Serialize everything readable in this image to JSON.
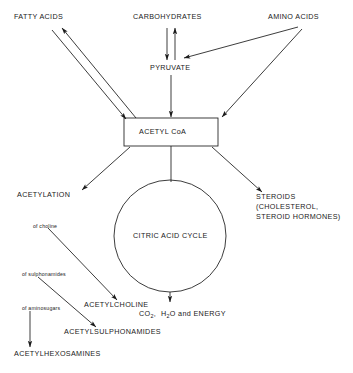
{
  "diagram": {
    "stroke_color": "#1a1a1a",
    "background_color": "#ffffff",
    "nodes": {
      "fatty_acids": "FATTY ACIDS",
      "carbohydrates": "CARBOHYDRATES",
      "amino_acids": "AMINO ACIDS",
      "pyruvate": "PYRUVATE",
      "acetyl_coa": "ACETYL CoA",
      "acetylation": "ACETYLATION",
      "citric_acid_cycle": "CITRIC ACID CYCLE",
      "steroids_line1": "STEROIDS",
      "steroids_line2": "(CHOLESTEROL,",
      "steroids_line3": "STEROID HORMONES)",
      "of_choline": "of choline",
      "of_sulphonamides": "of sulphonamides",
      "of_aminosugars": "of aminosugars",
      "acetylcholine": "ACETYLCHOLINE",
      "acetylsulphonamides": "ACETYLSULPHONAMIDES",
      "acetylhexosamines": "ACETYLHEXOSAMINES",
      "energy_co2": "CO",
      "energy_sub1": "2",
      "energy_mid": ",  H",
      "energy_sub2": "2",
      "energy_tail": "O and ENERGY"
    },
    "edges": [
      {
        "from": "fatty_acids",
        "to": "acetyl_coa",
        "label": ""
      },
      {
        "from": "acetyl_coa",
        "to": "fatty_acids",
        "label": ""
      },
      {
        "from": "carbohydrates",
        "to": "pyruvate",
        "label": ""
      },
      {
        "from": "pyruvate",
        "to": "carbohydrates",
        "label": ""
      },
      {
        "from": "amino_acids",
        "to": "pyruvate",
        "label": ""
      },
      {
        "from": "amino_acids",
        "to": "acetyl_coa",
        "label": ""
      },
      {
        "from": "pyruvate",
        "to": "acetyl_coa",
        "label": ""
      },
      {
        "from": "acetyl_coa",
        "to": "acetylation",
        "label": ""
      },
      {
        "from": "acetyl_coa",
        "to": "steroids",
        "label": ""
      },
      {
        "from": "acetyl_coa",
        "to": "citric_acid_cycle",
        "label": ""
      },
      {
        "from": "citric_acid_cycle",
        "to": "energy",
        "label": ""
      },
      {
        "from": "acetylation",
        "to": "acetylcholine",
        "label": "of choline"
      },
      {
        "from": "acetylation",
        "to": "acetylsulphonamides",
        "label": "of sulphonamides"
      },
      {
        "from": "acetylation",
        "to": "acetylhexosamines",
        "label": "of aminosugars"
      }
    ]
  }
}
